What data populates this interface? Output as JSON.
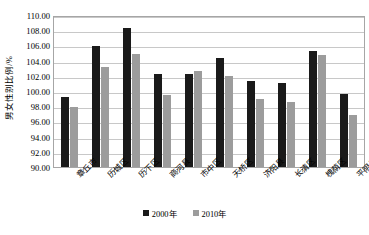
{
  "chart_data": {
    "type": "bar",
    "title": "",
    "subtitle": "",
    "xlabel": "",
    "ylabel": "男女性别比例/%",
    "ylim": [
      90.0,
      110.0
    ],
    "ytick_step": 2.0,
    "ytick_labels": [
      "110.00",
      "108.00",
      "106.00",
      "104.00",
      "102.00",
      "100.00",
      "98.00",
      "96.00",
      "94.00",
      "92.00",
      "90.00"
    ],
    "grid": true,
    "legend_position": "bottom-center",
    "categories": [
      "章丘市",
      "历城区",
      "历下区",
      "商河县",
      "市中区",
      "天桥区",
      "济阳县",
      "长清区",
      "槐荫区",
      "平阴县"
    ],
    "series": [
      {
        "name": "2000年",
        "color": "#1a1a1a",
        "values": [
          99.2,
          105.9,
          108.3,
          102.3,
          102.2,
          104.3,
          101.3,
          101.0,
          105.3,
          99.6
        ]
      },
      {
        "name": "2010年",
        "color": "#9c9c9c",
        "values": [
          97.9,
          103.2,
          104.9,
          99.5,
          102.6,
          102.0,
          99.0,
          98.5,
          104.7,
          96.8
        ]
      }
    ]
  },
  "colors": {
    "series_2000": "#1a1a1a",
    "series_2010": "#9c9c9c",
    "gridline": "#c8c8c8",
    "plot_border": "#a6a6a6",
    "background": "#ffffff",
    "text": "#000000"
  }
}
